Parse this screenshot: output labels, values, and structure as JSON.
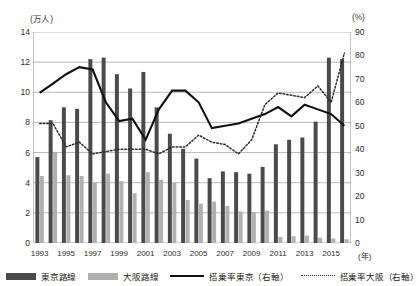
{
  "chart_data": {
    "type": "bar",
    "title": "",
    "xlabel": "(年)",
    "ylabel": "(万人)",
    "y2label": "(%)",
    "ylim": [
      0,
      14
    ],
    "y2lim": [
      0,
      90
    ],
    "yticks": [
      0,
      2,
      4,
      6,
      8,
      10,
      12,
      14
    ],
    "y2ticks": [
      0,
      10,
      20,
      30,
      40,
      50,
      60,
      70,
      80,
      90
    ],
    "grid": true,
    "legend_position": "bottom",
    "categories": [
      "1993",
      "1994",
      "1995",
      "1996",
      "1997",
      "1998",
      "1999",
      "2000",
      "2001",
      "2002",
      "2003",
      "2004",
      "2005",
      "2006",
      "2007",
      "2008",
      "2009",
      "2010",
      "2011",
      "2012",
      "2013",
      "2014",
      "2015",
      "2016"
    ],
    "tick_labels": [
      "1993",
      "",
      "1995",
      "",
      "1997",
      "",
      "1999",
      "",
      "2001",
      "",
      "2003",
      "",
      "2005",
      "",
      "2007",
      "",
      "2009",
      "",
      "2011",
      "",
      "2013",
      "",
      "2015",
      ""
    ],
    "series": [
      {
        "name": "東京路線",
        "kind": "bar",
        "axis": "left",
        "color": "#4a4a4a",
        "values": [
          5.7,
          8.15,
          9.0,
          8.9,
          12.2,
          12.3,
          11.2,
          10.25,
          11.35,
          9.0,
          7.25,
          6.25,
          5.6,
          4.3,
          4.75,
          4.7,
          4.6,
          5.05,
          6.55,
          6.85,
          7.0,
          8.05,
          12.3,
          12.2
        ]
      },
      {
        "name": "大阪路線",
        "kind": "bar",
        "axis": "left",
        "color": "#b0b0b0",
        "values": [
          4.45,
          6.05,
          4.5,
          4.45,
          4.0,
          4.6,
          4.1,
          3.3,
          4.7,
          4.2,
          4.0,
          2.85,
          2.6,
          2.75,
          2.45,
          2.1,
          2.05,
          2.15,
          0.4,
          0.45,
          0.5,
          0.35,
          0.3,
          0.25
        ]
      },
      {
        "name": "搭乗率東京（右軸）",
        "kind": "line",
        "style": "solid",
        "axis": "right",
        "color": "#111111",
        "values": [
          64,
          68,
          72,
          75,
          74,
          60,
          52,
          53,
          44,
          57,
          65,
          65,
          60,
          49,
          50,
          51,
          53,
          55,
          58,
          54,
          59,
          57,
          55,
          50
        ]
      },
      {
        "name": "搭乗率大阪（右軸）",
        "kind": "line",
        "style": "dotted",
        "axis": "right",
        "color": "#2b2b2b",
        "values": [
          51,
          51,
          41,
          43,
          38,
          39,
          40,
          40,
          40,
          38,
          41,
          41,
          46,
          43,
          42,
          38,
          44,
          59,
          64,
          63,
          62,
          67,
          60,
          81
        ]
      }
    ]
  },
  "legend": [
    {
      "label": "東京路線",
      "marker": "bar-dark"
    },
    {
      "label": "大阪路線",
      "marker": "bar-light"
    },
    {
      "label": "搭乗率東京（右軸）",
      "marker": "line-solid"
    },
    {
      "label": "搭乗率大阪（右軸）",
      "marker": "line-dotted"
    }
  ]
}
